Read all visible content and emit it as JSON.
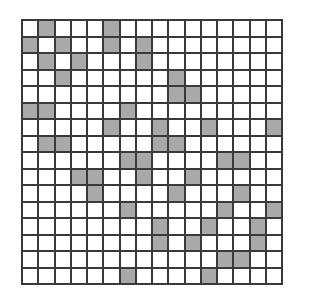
{
  "grid": {
    "rows": 16,
    "cols": 16,
    "filled_color": "#a9a9a9",
    "empty_color": "#ffffff",
    "line_color": "#3a3a3a",
    "filled_cells_by_row": [
      [
        1,
        5
      ],
      [
        0,
        2,
        5,
        7
      ],
      [
        1,
        3,
        7
      ],
      [
        2,
        9
      ],
      [
        9,
        10
      ],
      [
        0,
        1,
        6
      ],
      [
        5,
        8,
        11,
        15
      ],
      [
        1,
        2,
        8,
        9
      ],
      [
        6,
        7,
        12,
        13
      ],
      [
        3,
        4,
        7,
        10
      ],
      [
        4,
        9,
        13
      ],
      [
        6,
        12,
        15
      ],
      [
        8,
        11,
        14
      ],
      [
        8,
        10,
        14
      ],
      [
        12,
        13
      ],
      [
        6,
        11
      ]
    ]
  }
}
